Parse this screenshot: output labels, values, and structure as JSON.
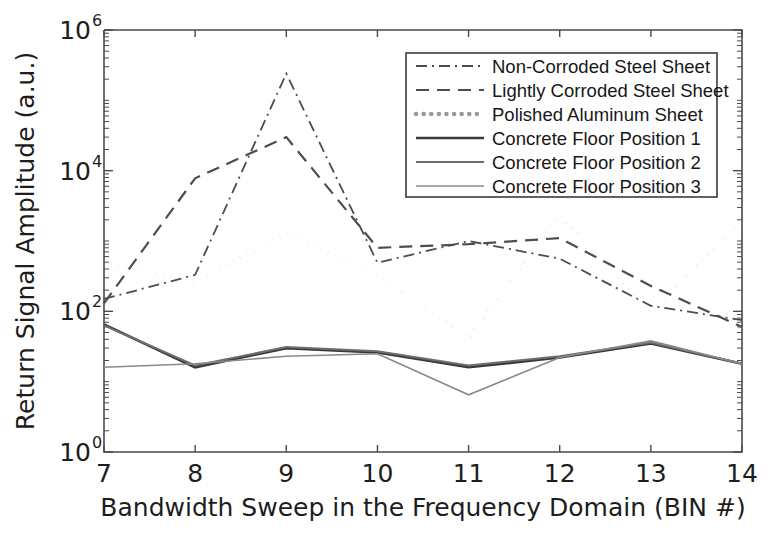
{
  "chart_data": {
    "type": "line",
    "title": "",
    "xlabel": "Bandwidth Sweep in the Frequency Domain (BIN #)",
    "ylabel": "Return Signal Amplitude (a.u.)",
    "x": [
      7,
      8,
      9,
      10,
      11,
      12,
      13,
      14
    ],
    "xlim": [
      7,
      14
    ],
    "ylim": [
      1,
      1000000
    ],
    "yscale": "log",
    "xtick_labels": [
      "7",
      "8",
      "9",
      "10",
      "11",
      "12",
      "13",
      "14"
    ],
    "ytick_labels": [
      "10^0",
      "10^2",
      "10^4",
      "10^6"
    ],
    "ytick_values": [
      1,
      100,
      10000,
      1000000
    ],
    "grid": false,
    "legend_position": "upper right",
    "series": [
      {
        "name": "Non-Corroded Steel Sheet",
        "style": "dashdot",
        "color": "#4d4d4d",
        "width": 1.8,
        "values": [
          150,
          330,
          240000,
          490,
          1000,
          560,
          120,
          75
        ]
      },
      {
        "name": "Lightly Corroded Steel Sheet",
        "style": "dashed",
        "color": "#4d4d4d",
        "width": 2.2,
        "values": [
          130,
          7800,
          30000,
          800,
          900,
          1100,
          230,
          60
        ]
      },
      {
        "name": "Polished Aluminum Sheet",
        "style": "dotted",
        "color": "#9a9a9a",
        "width": 4.5,
        "values": [
          500,
          260,
          1300,
          330,
          42,
          2300,
          95,
          1900
        ]
      },
      {
        "name": "Concrete Floor Position 1",
        "style": "solid",
        "color": "#3a3a3a",
        "width": 2.6,
        "values": [
          65,
          16,
          30,
          26,
          16,
          22,
          35,
          18
        ]
      },
      {
        "name": "Concrete Floor Position 2",
        "style": "solid",
        "color": "#6e6e6e",
        "width": 2.0,
        "values": [
          63,
          17,
          31,
          27,
          17,
          23,
          36,
          18
        ]
      },
      {
        "name": "Concrete Floor Position 3",
        "style": "solid",
        "color": "#8a8a8a",
        "width": 1.6,
        "values": [
          16,
          18,
          23,
          25,
          6.5,
          22,
          38,
          18
        ]
      }
    ]
  },
  "axes": {
    "x_title": "Bandwidth Sweep in the Frequency Domain (BIN #)",
    "y_title": "Return Signal Amplitude (a.u.)",
    "x_ticks": [
      "7",
      "8",
      "9",
      "10",
      "11",
      "12",
      "13",
      "14"
    ],
    "y_ticks": [
      {
        "base": "10",
        "exp": "6"
      },
      {
        "base": "10",
        "exp": "4"
      },
      {
        "base": "10",
        "exp": "2"
      },
      {
        "base": "10",
        "exp": "0"
      }
    ]
  },
  "legend": {
    "entries": [
      {
        "label": "Non-Corroded Steel Sheet"
      },
      {
        "label": "Lightly Corroded Steel Sheet"
      },
      {
        "label": "Polished Aluminum Sheet"
      },
      {
        "label": "Concrete Floor Position 1"
      },
      {
        "label": "Concrete Floor Position 2"
      },
      {
        "label": "Concrete Floor Position 3"
      }
    ]
  }
}
